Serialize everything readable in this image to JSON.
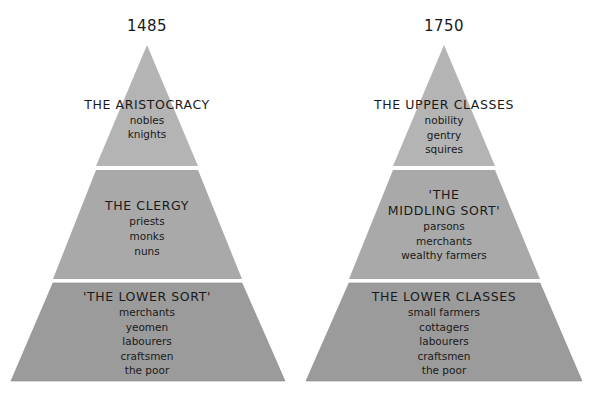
{
  "colors": {
    "background": "#ffffff",
    "tier_top": "#b4b4b4",
    "tier_middle": "#a9a9a9",
    "tier_bottom": "#9b9b9b",
    "divider": "#ffffff",
    "text": "#1a1a1a"
  },
  "pyramids": [
    {
      "year": "1485",
      "tiers": [
        {
          "title": "THE ARISTOCRACY",
          "items": [
            "nobles",
            "knights"
          ]
        },
        {
          "title": "THE CLERGY",
          "items": [
            "priests",
            "monks",
            "nuns"
          ]
        },
        {
          "title": "'THE LOWER SORT'",
          "items": [
            "merchants",
            "yeomen",
            "labourers",
            "craftsmen",
            "the poor"
          ]
        }
      ]
    },
    {
      "year": "1750",
      "tiers": [
        {
          "title": "THE UPPER CLASSES",
          "items": [
            "nobility",
            "gentry",
            "squires"
          ]
        },
        {
          "title_line1": "'THE",
          "title_line2": "MIDDLING SORT'",
          "items": [
            "parsons",
            "merchants",
            "wealthy farmers"
          ]
        },
        {
          "title": "THE LOWER CLASSES",
          "items": [
            "small farmers",
            "cottagers",
            "labourers",
            "craftsmen",
            "the poor"
          ]
        }
      ]
    }
  ]
}
